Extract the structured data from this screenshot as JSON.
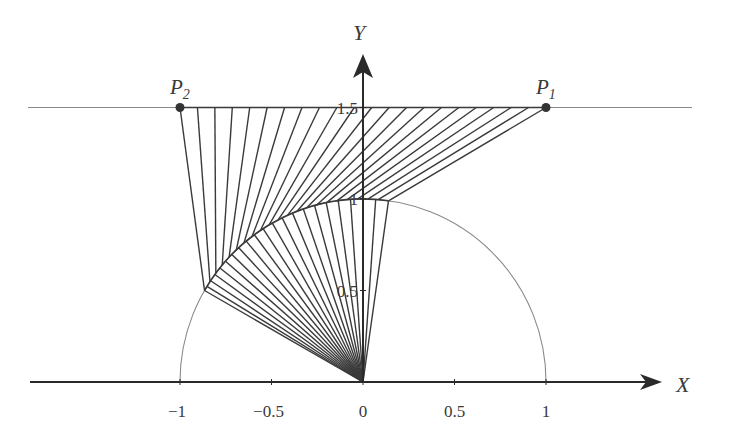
{
  "figure": {
    "type": "geometric-construction",
    "axes": {
      "x_label": "X",
      "y_label": "Y",
      "x_ticks": [
        {
          "value": -1,
          "label": "−1"
        },
        {
          "value": -0.5,
          "label": "−0.5"
        },
        {
          "value": 0,
          "label": "0"
        },
        {
          "value": 0.5,
          "label": "0.5"
        },
        {
          "value": 1,
          "label": "1"
        }
      ],
      "y_ticks": [
        {
          "value": 0.5,
          "label": "0.5"
        },
        {
          "value": 1,
          "label": "1"
        },
        {
          "value": 1.5,
          "label": "1.5"
        }
      ]
    },
    "points": [
      {
        "name": "P",
        "sub": "2",
        "x": -1,
        "y": 1.5
      },
      {
        "name": "P",
        "sub": "1",
        "x": 1,
        "y": 1.5
      }
    ],
    "horizontal_line_y": 1.5,
    "circle": {
      "cx": 0,
      "cy": 0,
      "r": 1,
      "from_deg": 0,
      "to_deg": 180
    },
    "upper_fan": {
      "count": 22,
      "top_from_x": -1,
      "top_to_x": 1,
      "arc_from_deg": 150,
      "arc_to_deg": 82
    },
    "lower_fan": {
      "count": 22,
      "arc_from_deg": 150,
      "arc_to_deg": 82
    },
    "colors": {
      "line": "#3a3a3a",
      "thin": "#8a8a8a",
      "axis": "#2a2a2a",
      "point": "#333333"
    }
  }
}
